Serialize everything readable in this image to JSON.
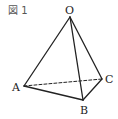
{
  "figure": {
    "label": "図 1",
    "vertices": {
      "O": {
        "label": "O",
        "x": 70,
        "y": 17
      },
      "A": {
        "label": "A",
        "x": 24,
        "y": 86
      },
      "B": {
        "label": "B",
        "x": 83,
        "y": 100
      },
      "C": {
        "label": "C",
        "x": 102,
        "y": 79
      }
    },
    "solid_edges": [
      "OA",
      "OB",
      "OC",
      "AB",
      "BC"
    ],
    "dashed_edges": [
      "AC"
    ],
    "line_color": "#222222"
  }
}
